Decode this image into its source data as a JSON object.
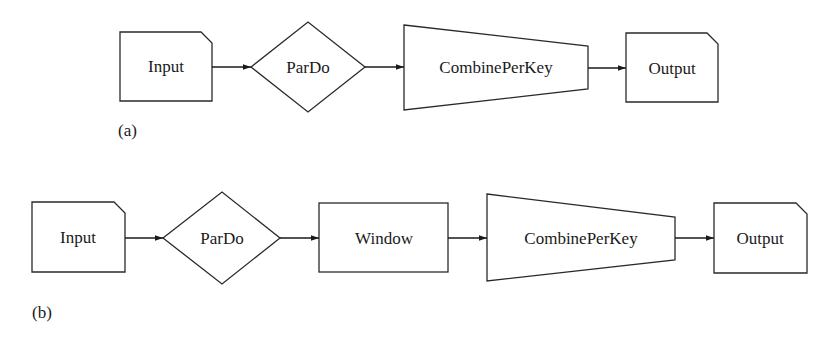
{
  "diagrams": [
    {
      "id": "a",
      "caption": "(a)",
      "nodes": [
        {
          "label": "Input",
          "shape": "card"
        },
        {
          "label": "ParDo",
          "shape": "diamond"
        },
        {
          "label": "CombinePerKey",
          "shape": "trapezoid"
        },
        {
          "label": "Output",
          "shape": "card"
        }
      ],
      "edges": [
        [
          "Input",
          "ParDo"
        ],
        [
          "ParDo",
          "CombinePerKey"
        ],
        [
          "CombinePerKey",
          "Output"
        ]
      ]
    },
    {
      "id": "b",
      "caption": "(b)",
      "nodes": [
        {
          "label": "Input",
          "shape": "card"
        },
        {
          "label": "ParDo",
          "shape": "diamond"
        },
        {
          "label": "Window",
          "shape": "rectangle"
        },
        {
          "label": "CombinePerKey",
          "shape": "trapezoid"
        },
        {
          "label": "Output",
          "shape": "card"
        }
      ],
      "edges": [
        [
          "Input",
          "ParDo"
        ],
        [
          "ParDo",
          "Window"
        ],
        [
          "Window",
          "CombinePerKey"
        ],
        [
          "CombinePerKey",
          "Output"
        ]
      ]
    }
  ]
}
